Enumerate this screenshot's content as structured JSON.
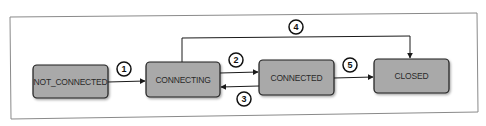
{
  "diagram": {
    "type": "state-transition",
    "states": [
      {
        "id": "not_connected",
        "label": "NOT_CONNECTED"
      },
      {
        "id": "connecting",
        "label": "CONNECTING"
      },
      {
        "id": "connected",
        "label": "CONNECTED"
      },
      {
        "id": "closed",
        "label": "CLOSED"
      }
    ],
    "transitions": [
      {
        "label": "1",
        "from": "not_connected",
        "to": "connecting"
      },
      {
        "label": "2",
        "from": "connecting",
        "to": "connected"
      },
      {
        "label": "3",
        "from": "connected",
        "to": "connecting"
      },
      {
        "label": "4",
        "from": "connecting",
        "to": "closed"
      },
      {
        "label": "5",
        "from": "connected",
        "to": "closed"
      }
    ],
    "colors": {
      "state_fill": "#a9a9a9",
      "state_stroke": "#1e1e1e",
      "line": "#1a1a1a",
      "frame": "#8a8a8a",
      "background": "#ffffff"
    }
  }
}
